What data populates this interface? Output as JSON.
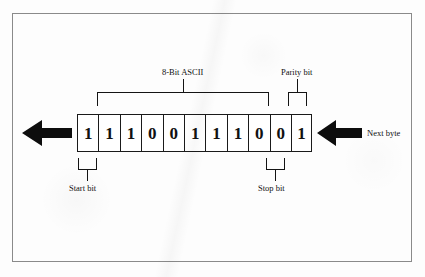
{
  "figure": {
    "frame_border_color": "#8a8a8a",
    "ink_color": "#141414",
    "background_color": "#fdfdfd"
  },
  "frame_bits": [
    {
      "index": 1,
      "value": "1",
      "role": "start-bit"
    },
    {
      "index": 2,
      "value": "1",
      "role": "ascii-data"
    },
    {
      "index": 3,
      "value": "1",
      "role": "ascii-data"
    },
    {
      "index": 4,
      "value": "0",
      "role": "ascii-data"
    },
    {
      "index": 5,
      "value": "0",
      "role": "ascii-data"
    },
    {
      "index": 6,
      "value": "1",
      "role": "ascii-data"
    },
    {
      "index": 7,
      "value": "1",
      "role": "ascii-data"
    },
    {
      "index": 8,
      "value": "1",
      "role": "ascii-data"
    },
    {
      "index": 9,
      "value": "0",
      "role": "ascii-data"
    },
    {
      "index": 10,
      "value": "0",
      "role": "stop-bit"
    },
    {
      "index": 11,
      "value": "1",
      "role": "parity-bit"
    }
  ],
  "annotations": {
    "ascii_label": "8-Bit ASCII",
    "parity_label": "Parity bit",
    "start_label": "Start bit",
    "stop_label": "Stop bit",
    "next_byte_label": "Next byte"
  },
  "icons": {
    "output_arrow": "arrow-left-icon",
    "input_arrow": "arrow-left-icon"
  }
}
